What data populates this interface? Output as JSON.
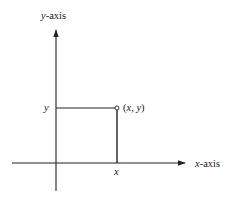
{
  "diagram": {
    "y_axis_label_var": "y",
    "y_axis_label_suffix": "-axis",
    "x_axis_label_var": "x",
    "x_axis_label_suffix": "-axis",
    "point_label_open": "(",
    "point_label_x": "x",
    "point_label_sep": ", ",
    "point_label_y": "y",
    "point_label_close": ")",
    "y_tick_label": "y",
    "x_tick_label": "x",
    "colors": {
      "line": "#222222",
      "background": "#ffffff"
    }
  }
}
